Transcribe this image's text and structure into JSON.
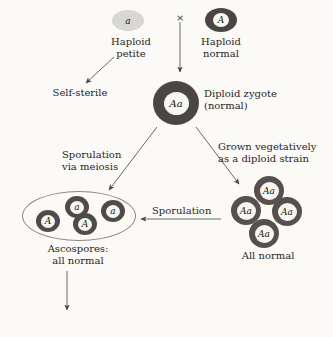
{
  "figure": {
    "background_color": "#fbfaf7",
    "ink_color": "#2a2623",
    "cell_dark_color": "#4a4644",
    "cell_pale_color": "#d8d7d3"
  },
  "parents": {
    "petite": {
      "genotype": "a",
      "label": "Haploid\npetite"
    },
    "cross_symbol": "×",
    "normal": {
      "genotype": "A",
      "label": "Haploid\nnormal"
    }
  },
  "outcomes": {
    "self_sterile": "Self-sterile"
  },
  "zygote": {
    "genotype": "Aa",
    "label": "Diploid zygote\n(normal)"
  },
  "branches": {
    "left": "Sporulation\nvia meiosis",
    "right": "Grown vegetatively\nas a diploid strain",
    "return": "Sporulation"
  },
  "ascospores": {
    "label": "Ascospores:\nall normal",
    "cells": [
      {
        "genotype": "A"
      },
      {
        "genotype": "a"
      },
      {
        "genotype": "A"
      },
      {
        "genotype": "a"
      }
    ]
  },
  "diploid_strain": {
    "label": "All normal",
    "cells": [
      {
        "genotype": "Aa"
      },
      {
        "genotype": "Aa"
      },
      {
        "genotype": "Aa"
      },
      {
        "genotype": "Aa"
      }
    ]
  }
}
